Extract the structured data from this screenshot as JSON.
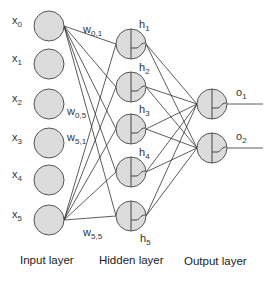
{
  "diagram": {
    "type": "neural-network",
    "colors": {
      "node_fill": "#dcdcdc",
      "node_stroke": "#555555",
      "edge": "#333333",
      "text": "#333333"
    },
    "input_layer": {
      "label": "Input layer",
      "nodes": [
        {
          "id": "x0",
          "base": "x",
          "sub": "0",
          "cx": 49,
          "cy": 26
        },
        {
          "id": "x1",
          "base": "x",
          "sub": "1",
          "cx": 49,
          "cy": 64
        },
        {
          "id": "x2",
          "base": "x",
          "sub": "2",
          "cx": 49,
          "cy": 104
        },
        {
          "id": "x3",
          "base": "x",
          "sub": "3",
          "cx": 49,
          "cy": 143
        },
        {
          "id": "x4",
          "base": "x",
          "sub": "4",
          "cx": 49,
          "cy": 180
        },
        {
          "id": "x5",
          "base": "x",
          "sub": "5",
          "cx": 49,
          "cy": 220
        }
      ]
    },
    "hidden_layer": {
      "label": "Hidden layer",
      "nodes": [
        {
          "id": "h1",
          "base": "h",
          "sub": "1",
          "cx": 131,
          "cy": 44
        },
        {
          "id": "h2",
          "base": "h",
          "sub": "2",
          "cx": 131,
          "cy": 87
        },
        {
          "id": "h3",
          "base": "h",
          "sub": "3",
          "cx": 131,
          "cy": 129
        },
        {
          "id": "h4",
          "base": "h",
          "sub": "4",
          "cx": 131,
          "cy": 172
        },
        {
          "id": "h5",
          "base": "h",
          "sub": "5",
          "cx": 131,
          "cy": 216
        }
      ]
    },
    "output_layer": {
      "label": "Output layer",
      "nodes": [
        {
          "id": "o1",
          "base": "o",
          "sub": "1",
          "cx": 212,
          "cy": 104
        },
        {
          "id": "o2",
          "base": "o",
          "sub": "2",
          "cx": 212,
          "cy": 148
        }
      ]
    },
    "weight_labels": [
      {
        "base": "w",
        "sub": "0,1",
        "x": 83,
        "y": 33
      },
      {
        "base": "w",
        "sub": "0,5",
        "x": 67,
        "y": 115
      },
      {
        "base": "w",
        "sub": "5,1",
        "x": 67,
        "y": 141
      },
      {
        "base": "w",
        "sub": "5,5",
        "x": 83,
        "y": 236
      }
    ],
    "connections": {
      "input_to_hidden_from": [
        "x0",
        "x5"
      ],
      "hidden_to_output": "all"
    },
    "activation_icon": "step-sigmoid-icon"
  }
}
